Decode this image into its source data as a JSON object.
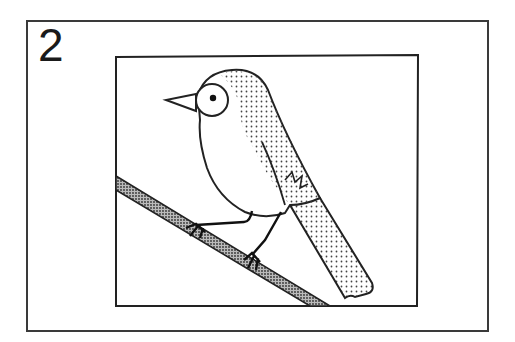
{
  "panel": {
    "number": "2",
    "subject": "bird-perched-on-branch-illustration"
  },
  "colors": {
    "line": "#1a1a1a",
    "background": "#ffffff",
    "stipple": "#555555"
  }
}
